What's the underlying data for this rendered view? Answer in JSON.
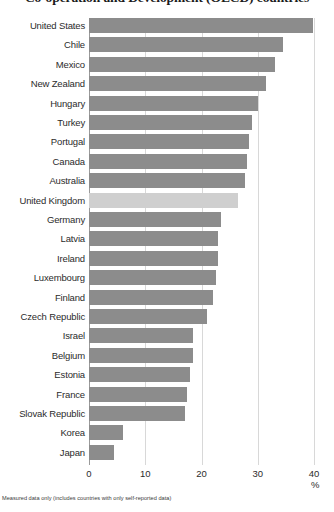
{
  "chart_data": {
    "type": "bar",
    "orientation": "horizontal",
    "title": "Co-operation and Development (OECD) countries",
    "xlabel": "%",
    "ylabel": "",
    "xlim": [
      0,
      40
    ],
    "xticks": [
      0,
      10,
      20,
      30,
      40
    ],
    "grid": true,
    "legend": "none",
    "note": "Measured data only (includes countries with only self-reported data)",
    "highlight_category": "United Kingdom",
    "colors": {
      "bar": "#8c8c8c",
      "bar_highlight": "#cfcfcf",
      "gridline": "#d8d8d8",
      "axis": "#9a9a9a",
      "text": "#231f20"
    },
    "categories": [
      "United States",
      "Chile",
      "Mexico",
      "New Zealand",
      "Hungary",
      "Turkey",
      "Portugal",
      "Canada",
      "Australia",
      "United Kingdom",
      "Germany",
      "Latvia",
      "Ireland",
      "Luxembourg",
      "Finland",
      "Czech Republic",
      "Israel",
      "Belgium",
      "Estonia",
      "France",
      "Slovak Republic",
      "Korea",
      "Japan"
    ],
    "values": [
      39.8,
      34.5,
      33.0,
      31.5,
      30.0,
      29.0,
      28.5,
      28.0,
      27.8,
      26.5,
      23.5,
      23.0,
      23.0,
      22.5,
      22.0,
      21.0,
      18.5,
      18.5,
      18.0,
      17.5,
      17.0,
      6.0,
      4.5
    ]
  }
}
